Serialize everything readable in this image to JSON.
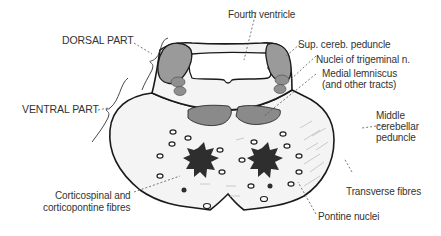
{
  "diagram": {
    "colors": {
      "outline": "#1a1a1a",
      "fill": "#f4f4f4",
      "gray_structures": "#8f8f8f",
      "dark_tracts": "#2e2e2e",
      "label_text": "#333333",
      "leader_line": "#555555"
    },
    "regions": [
      {
        "id": "dorsal",
        "label": "DORSAL PART"
      },
      {
        "id": "ventral",
        "label": "VENTRAL PART"
      }
    ],
    "labels": {
      "fourth_ventricle": "Fourth ventricle",
      "sup_cereb_peduncle": "Sup. cereb. peduncle",
      "nuclei_trigeminal": "Nuclei of trigeminal n.",
      "medial_lemniscus_1": "Medial lemniscus",
      "medial_lemniscus_2": "(and other tracts)",
      "middle_cerebellar_1": "Middle",
      "middle_cerebellar_2": "cerebellar",
      "middle_cerebellar_3": "peduncle",
      "transverse_fibres": "Transverse fibres",
      "pontine_nuclei": "Pontine nuclei",
      "corticospinal_1": "Corticospinal and",
      "corticospinal_2": "corticopontine fibres",
      "dorsal_part": "DORSAL PART",
      "ventral_part": "VENTRAL PART"
    }
  }
}
